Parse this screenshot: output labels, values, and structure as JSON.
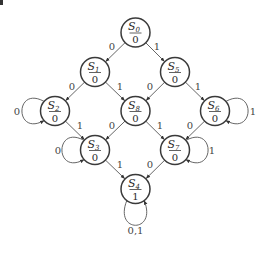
{
  "diagram": {
    "type": "moore-state-machine",
    "node_radius": 14.5,
    "nodes": [
      {
        "id": "S0",
        "name": "S",
        "sub": "0",
        "output": "0",
        "x": 135.5,
        "y": 32.5
      },
      {
        "id": "S1",
        "name": "S",
        "sub": "1",
        "output": "0",
        "x": 95,
        "y": 72
      },
      {
        "id": "S5",
        "name": "S",
        "sub": "5",
        "output": "0",
        "x": 175,
        "y": 72
      },
      {
        "id": "S2",
        "name": "S",
        "sub": "2",
        "output": "0",
        "x": 55,
        "y": 111
      },
      {
        "id": "S8",
        "name": "S",
        "sub": "8",
        "output": "0",
        "x": 135.5,
        "y": 111
      },
      {
        "id": "S6",
        "name": "S",
        "sub": "6",
        "output": "0",
        "x": 215,
        "y": 111
      },
      {
        "id": "S3",
        "name": "S",
        "sub": "3",
        "output": "0",
        "x": 95,
        "y": 150
      },
      {
        "id": "S7",
        "name": "S",
        "sub": "7",
        "output": "0",
        "x": 175,
        "y": 150
      },
      {
        "id": "S4",
        "name": "S",
        "sub": "4",
        "output": "1",
        "x": 135.5,
        "y": 189
      }
    ],
    "edges": [
      {
        "from": "S0",
        "to": "S1",
        "label": "0",
        "lx": 112,
        "ly": 50
      },
      {
        "from": "S0",
        "to": "S5",
        "label": "1",
        "lx": 157,
        "ly": 50
      },
      {
        "from": "S1",
        "to": "S2",
        "label": "0",
        "lx": 72,
        "ly": 90
      },
      {
        "from": "S1",
        "to": "S8",
        "label": "1",
        "lx": 120,
        "ly": 90
      },
      {
        "from": "S5",
        "to": "S8",
        "label": "0",
        "lx": 150,
        "ly": 90
      },
      {
        "from": "S5",
        "to": "S6",
        "label": "1",
        "lx": 198,
        "ly": 90
      },
      {
        "from": "S2",
        "to": "S3",
        "label": "1",
        "lx": 80,
        "ly": 129
      },
      {
        "from": "S8",
        "to": "S3",
        "label": "0",
        "lx": 112,
        "ly": 129
      },
      {
        "from": "S8",
        "to": "S7",
        "label": "1",
        "lx": 160,
        "ly": 129
      },
      {
        "from": "S6",
        "to": "S7",
        "label": "0",
        "lx": 190,
        "ly": 129
      },
      {
        "from": "S3",
        "to": "S4",
        "label": "1",
        "lx": 120,
        "ly": 168
      },
      {
        "from": "S7",
        "to": "S4",
        "label": "0",
        "lx": 150,
        "ly": 168
      }
    ],
    "self_loops": [
      {
        "node": "S2",
        "side": "left",
        "label": "0",
        "lx": 17,
        "ly": 115
      },
      {
        "node": "S6",
        "side": "right",
        "label": "1",
        "lx": 253,
        "ly": 115
      },
      {
        "node": "S3",
        "side": "left",
        "label": "0",
        "lx": 58,
        "ly": 154
      },
      {
        "node": "S7",
        "side": "right",
        "label": "1",
        "lx": 212,
        "ly": 154
      },
      {
        "node": "S4",
        "side": "bottom",
        "label": "0,1",
        "lx": 135.5,
        "ly": 234
      }
    ]
  }
}
